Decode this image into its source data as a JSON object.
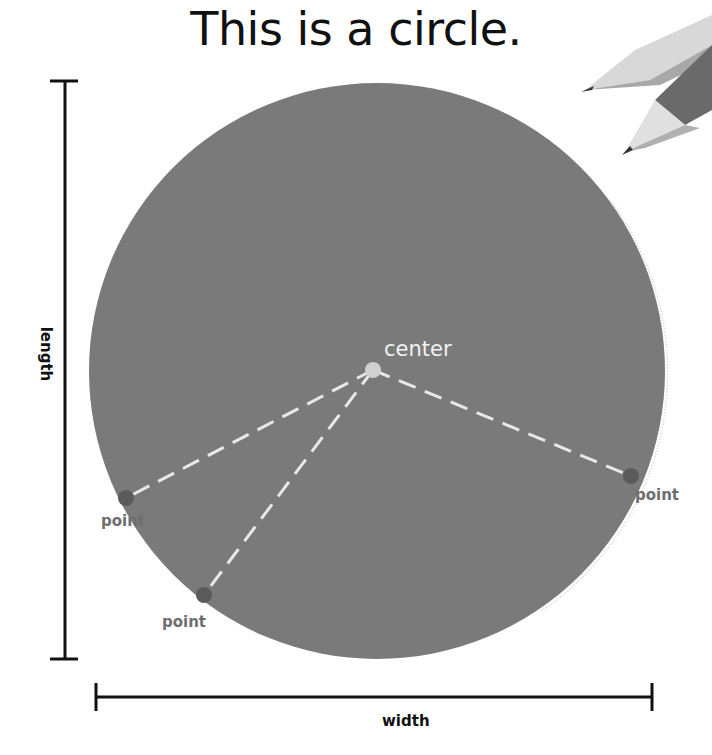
{
  "title": "This is a circle.",
  "labels": {
    "center": "center",
    "point_left": "point",
    "point_bottom": "point",
    "point_right": "point",
    "length": "length",
    "width": "width"
  },
  "colors": {
    "circle_fill": "#7a7a7a",
    "point_fill": "#5a5a5a",
    "center_fill": "#d0d0d0",
    "radius_dash": "#e8e8e8",
    "dimension_line": "#111111",
    "point_label": "#6e6e6e"
  },
  "icons": [
    "pencil-icon",
    "pencil-icon"
  ]
}
